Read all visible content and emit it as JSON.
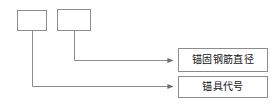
{
  "diagram": {
    "type": "callout-annotation-diagram",
    "background_color": "#ffffff",
    "line_color": "#8c8c8c",
    "box_border_color": "#8c8c8c",
    "text_color": "#141414",
    "blank_boxes": [
      {
        "id": "slot-1",
        "name": "anchor-code-slot",
        "text": "",
        "x": 17,
        "y": 10,
        "width": 30,
        "height": 21
      },
      {
        "id": "slot-2",
        "name": "rebar-diameter-slot",
        "text": "",
        "x": 57,
        "y": 9,
        "width": 34,
        "height": 22
      }
    ],
    "callout_boxes": [
      {
        "id": "callout-rebar-diameter",
        "name": "anchorage-rebar-diameter-label",
        "text": "锚固钢筋直径",
        "x": 178,
        "y": 48,
        "width": 90,
        "height": 24
      },
      {
        "id": "callout-anchor-code",
        "name": "anchorage-device-code-label",
        "text": "锚具代号",
        "x": 178,
        "y": 76,
        "width": 90,
        "height": 22
      }
    ],
    "leader_lines": [
      {
        "id": "leader-1",
        "name": "leader-line-to-anchor-code",
        "from_slot": "slot-1",
        "to_callout": "callout-anchor-code",
        "path": "M32,31 L32,86 L174,86",
        "arrow_at": {
          "x": 176,
          "y": 86
        }
      },
      {
        "id": "leader-2",
        "name": "leader-line-to-rebar-diameter",
        "from_slot": "slot-2",
        "to_callout": "callout-rebar-diameter",
        "path": "M74,31 L74,60 L174,60",
        "arrow_at": {
          "x": 176,
          "y": 60
        }
      }
    ]
  }
}
